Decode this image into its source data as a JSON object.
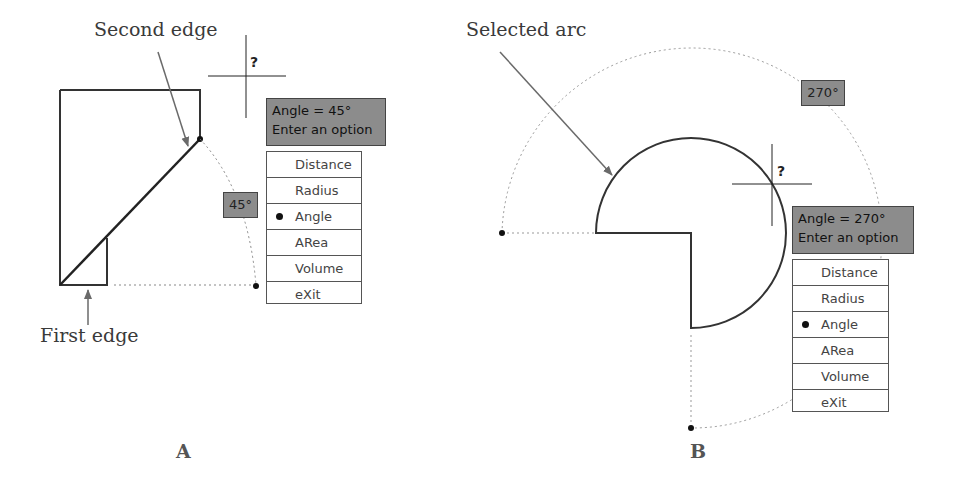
{
  "panel_a": {
    "letter": "A",
    "callouts": {
      "second_edge": "Second edge",
      "first_edge": "First edge"
    },
    "angle_badge": "45°",
    "tooltip": {
      "line1": "Angle = 45°",
      "line2": "Enter an option"
    },
    "menu": [
      {
        "label": "Distance",
        "selected": false
      },
      {
        "label": "Radius",
        "selected": false
      },
      {
        "label": "Angle",
        "selected": true
      },
      {
        "label": "ARea",
        "selected": false
      },
      {
        "label": "Volume",
        "selected": false
      },
      {
        "label": "eXit",
        "selected": false
      }
    ]
  },
  "panel_b": {
    "letter": "B",
    "callouts": {
      "selected_arc": "Selected arc"
    },
    "angle_badge": "270°",
    "tooltip": {
      "line1": "Angle = 270°",
      "line2": "Enter an option"
    },
    "menu": [
      {
        "label": "Distance",
        "selected": false
      },
      {
        "label": "Radius",
        "selected": false
      },
      {
        "label": "Angle",
        "selected": true
      },
      {
        "label": "ARea",
        "selected": false
      },
      {
        "label": "Volume",
        "selected": false
      },
      {
        "label": "eXit",
        "selected": false
      }
    ]
  },
  "cursor_icon": "crosshair-with-question-icon"
}
